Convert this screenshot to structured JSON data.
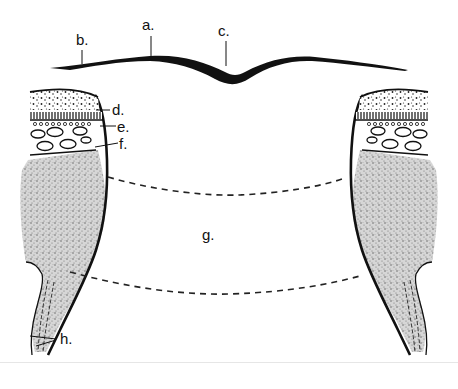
{
  "figure": {
    "type": "anatomical cross-section diagram",
    "colors": {
      "ink": "#111111",
      "stipple": "#bdbdbd",
      "background": "#ffffff"
    }
  },
  "labels": {
    "a": "a.",
    "b": "b.",
    "c": "c.",
    "d": "d.",
    "e": "e.",
    "f": "f.",
    "g": "g.",
    "h": "h."
  }
}
